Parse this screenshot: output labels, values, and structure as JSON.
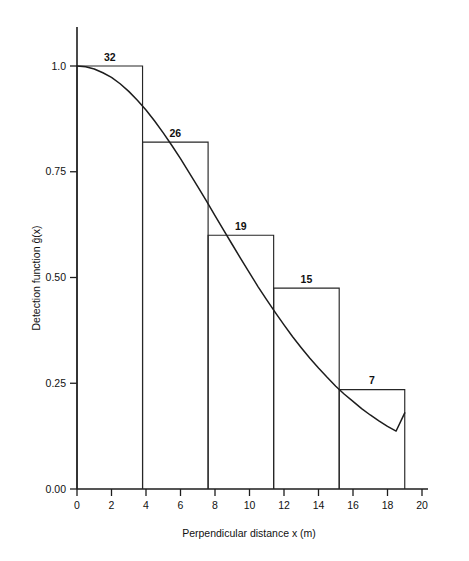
{
  "chart_data": {
    "type": "bar",
    "title": "",
    "subtitle": "",
    "xlabel": "Perpendicular distance x  (m)",
    "ylabel": "Detection function ĝ(x)",
    "xlim": [
      0,
      20
    ],
    "ylim": [
      0,
      1.08
    ],
    "grid": false,
    "legend": null,
    "xticks": [
      0,
      2,
      4,
      6,
      8,
      10,
      12,
      14,
      16,
      18,
      20
    ],
    "xtick_labels": [
      "0",
      "2",
      "4",
      "6",
      "8",
      "10",
      "12",
      "14",
      "16",
      "18",
      "20"
    ],
    "yticks": [
      0.0,
      0.25,
      0.5,
      0.75,
      1.0
    ],
    "ytick_labels": [
      "0.00",
      "0.25",
      "0.50",
      "0.75",
      "1.0"
    ],
    "bins": [
      {
        "x0": 0.0,
        "x1": 3.8,
        "height": 1.0,
        "label": "32",
        "count": 32
      },
      {
        "x0": 3.8,
        "x1": 7.6,
        "height": 0.82,
        "label": "26",
        "count": 26
      },
      {
        "x0": 7.6,
        "x1": 11.4,
        "height": 0.6,
        "label": "19",
        "count": 19
      },
      {
        "x0": 11.4,
        "x1": 15.2,
        "height": 0.475,
        "label": "15",
        "count": 15
      },
      {
        "x0": 15.2,
        "x1": 19.0,
        "height": 0.235,
        "label": "7",
        "count": 7
      }
    ],
    "series": [
      {
        "name": "fitted detection function",
        "type": "line",
        "x": [
          0.0,
          0.5,
          1.0,
          1.5,
          2.0,
          2.5,
          3.0,
          3.5,
          4.0,
          4.5,
          5.0,
          5.5,
          6.0,
          6.5,
          7.0,
          7.5,
          8.0,
          8.5,
          9.0,
          9.5,
          10.0,
          10.5,
          11.0,
          11.5,
          12.0,
          12.5,
          13.0,
          13.5,
          14.0,
          14.5,
          15.0,
          15.5,
          16.0,
          16.5,
          17.0,
          17.5,
          18.0,
          18.5,
          19.0
        ],
        "y": [
          1.0,
          0.998,
          0.993,
          0.984,
          0.973,
          0.958,
          0.94,
          0.919,
          0.896,
          0.87,
          0.842,
          0.812,
          0.781,
          0.748,
          0.715,
          0.681,
          0.646,
          0.612,
          0.578,
          0.544,
          0.511,
          0.478,
          0.447,
          0.417,
          0.388,
          0.36,
          0.334,
          0.309,
          0.286,
          0.264,
          0.243,
          0.224,
          0.207,
          0.19,
          0.175,
          0.161,
          0.148,
          0.137,
          0.18
        ]
      }
    ],
    "axis_colors": {
      "axis": "#1d1d1d",
      "bar": "#262626",
      "curve": "#1d1d1d"
    }
  },
  "figure": {
    "background": "#ffffff",
    "x_axis_title": "Perpendicular distance x  (m)",
    "y_axis_title": "Detection function ĝ(x)"
  }
}
